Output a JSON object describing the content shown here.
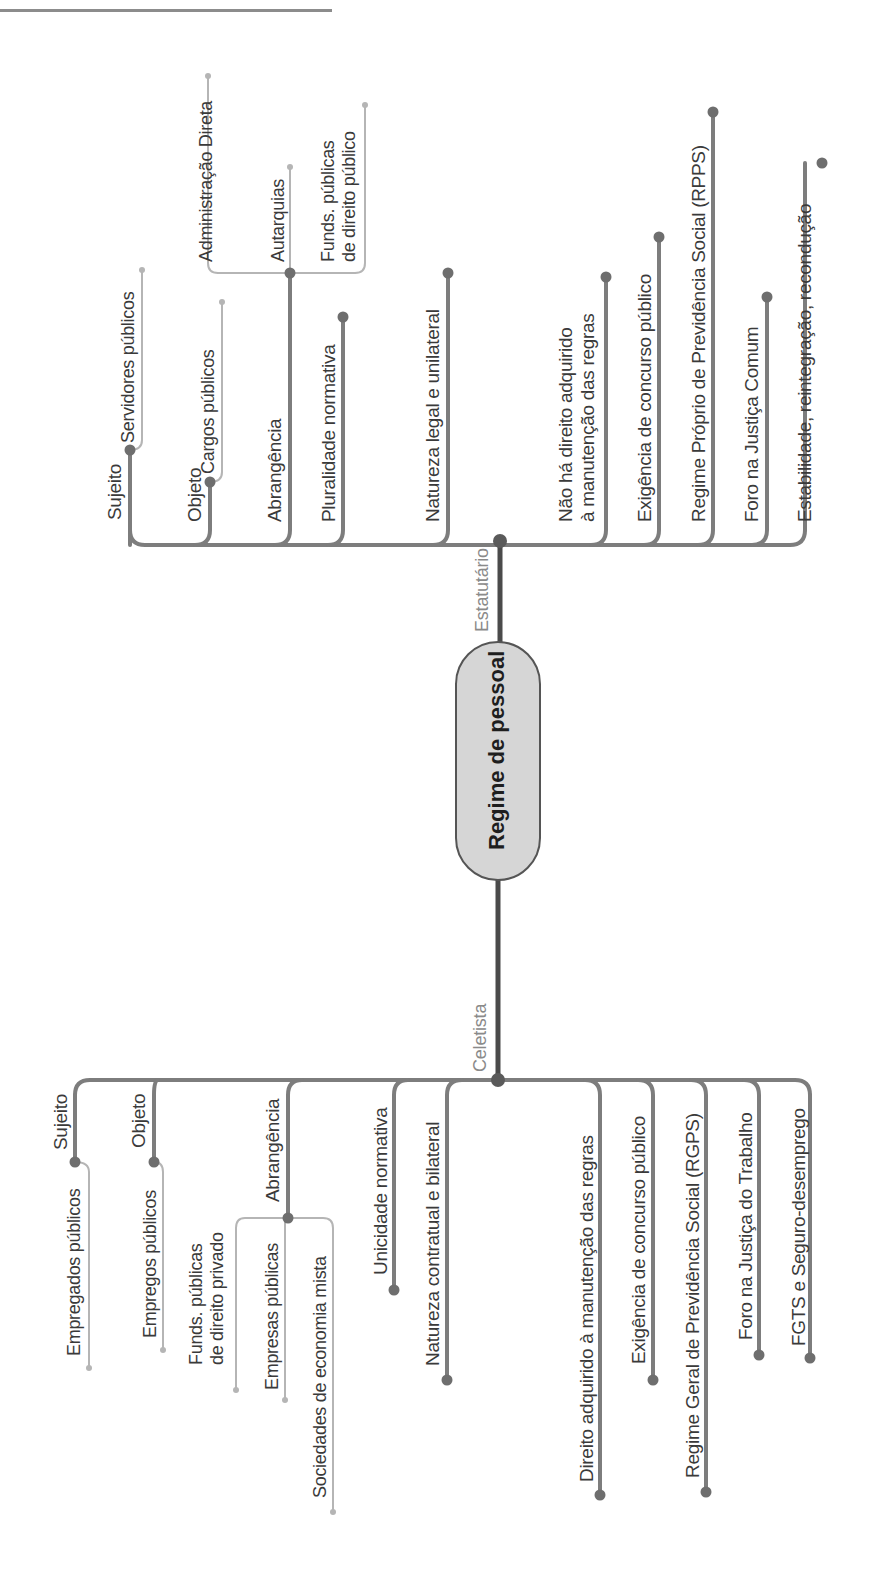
{
  "title": "Regime de pessoal",
  "branches": {
    "estatutario": {
      "label": "Estatutário",
      "items": [
        {
          "label": "Sujeito",
          "child": "Servidores públicos"
        },
        {
          "label": "Objeto",
          "child": "Cargos públicos"
        },
        {
          "label": "Abrangência",
          "children": [
            "Administração Direta",
            "Autarquias",
            "Funds. públicas\nde direito público"
          ]
        },
        {
          "label": "Pluralidade normativa"
        },
        {
          "label": "Natureza legal e unilateral"
        },
        {
          "label": "Não há direito adquirido\nà manutenção das regras"
        },
        {
          "label": "Exigência de concurso público"
        },
        {
          "label": "Regime Próprio de Previdência Social (RPPS)"
        },
        {
          "label": "Foro na Justiça Comum"
        },
        {
          "label": "Estabilidade, reintegração, recondução"
        }
      ]
    },
    "celetista": {
      "label": "Celetista",
      "items": [
        {
          "label": "Sujeito",
          "child": "Empregados públicos"
        },
        {
          "label": "Objeto",
          "child": "Empregos públicos"
        },
        {
          "label": "Abrangência",
          "children": [
            "Funds. públicas\nde direito privado",
            "Empresas públicas",
            "Sociedades de economia mista"
          ]
        },
        {
          "label": "Unicidade normativa"
        },
        {
          "label": "Natureza contratual e bilateral"
        },
        {
          "label": "Direito adquirido à manutenção das regras"
        },
        {
          "label": "Exigência de concurso público"
        },
        {
          "label": "Regime Geral de Previdência Social (RGPS)"
        },
        {
          "label": "Foro na Justiça do Trabalho"
        },
        {
          "label": "FGTS e Seguro-desemprego"
        }
      ]
    }
  },
  "colors": {
    "trunk": "#4a4a4a",
    "branch": "#7d7d7d",
    "leaf": "#b5b5b5",
    "node_fill": "#d6d6d6",
    "text": "#3a3a3a",
    "branch_text": "#8a8a8a"
  }
}
